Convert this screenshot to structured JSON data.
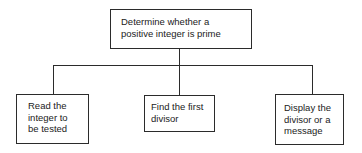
{
  "diagram": {
    "type": "structure-chart",
    "root": {
      "lines": [
        "Determine whether a",
        "positive integer is prime"
      ]
    },
    "children": [
      {
        "lines": [
          "Read the",
          "integer to",
          "be tested"
        ]
      },
      {
        "lines": [
          "Find the first",
          "divisor"
        ]
      },
      {
        "lines": [
          "Display the",
          "divisor or a",
          "message"
        ]
      }
    ],
    "colors": {
      "line": "#2b2b2b",
      "text": "#222222",
      "background": "#ffffff"
    }
  }
}
